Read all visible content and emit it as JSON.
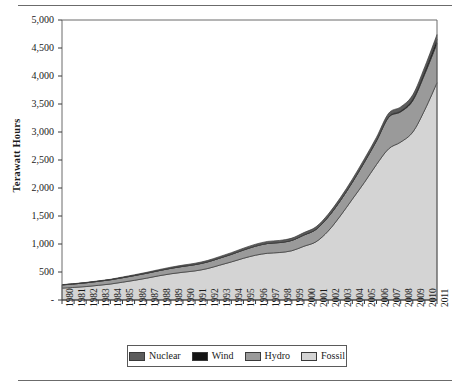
{
  "chart_data": {
    "type": "area",
    "stacked": true,
    "title": "",
    "xlabel": "",
    "ylabel": "Terawatt Hours",
    "ylim": [
      0,
      5000
    ],
    "ytick_labels": [
      "-",
      "500",
      "1,000",
      "1,500",
      "2,000",
      "2,500",
      "3,000",
      "3,500",
      "4,000",
      "4,500",
      "5,000"
    ],
    "ytick_values": [
      0,
      500,
      1000,
      1500,
      2000,
      2500,
      3000,
      3500,
      4000,
      4500,
      5000
    ],
    "grid": false,
    "legend_position": "bottom",
    "categories": [
      "1980",
      "1981",
      "1982",
      "1983",
      "1984",
      "1985",
      "1986",
      "1987",
      "1988",
      "1989",
      "1990",
      "1991",
      "1992",
      "1993",
      "1994",
      "1995",
      "1996",
      "1997",
      "1998",
      "1999",
      "2000",
      "2001",
      "2002",
      "2003",
      "2004",
      "2005",
      "2006",
      "2007",
      "2008",
      "2009",
      "2010",
      "2011"
    ],
    "series": [
      {
        "name": "Fossil",
        "color": "#d4d4d4",
        "values": [
          212,
          225,
          240,
          262,
          285,
          318,
          352,
          390,
          432,
          468,
          496,
          520,
          560,
          620,
          680,
          745,
          800,
          835,
          848,
          880,
          960,
          1040,
          1230,
          1500,
          1800,
          2100,
          2420,
          2700,
          2820,
          3000,
          3400,
          3880
        ]
      },
      {
        "name": "Hydro",
        "color": "#9a9a9a",
        "values": [
          58,
          62,
          68,
          72,
          76,
          80,
          85,
          88,
          92,
          98,
          105,
          112,
          118,
          125,
          135,
          148,
          162,
          175,
          178,
          185,
          200,
          220,
          250,
          270,
          300,
          360,
          420,
          560,
          540,
          560,
          640,
          700
        ]
      },
      {
        "name": "Wind",
        "color": "#141414",
        "values": [
          0,
          0,
          0,
          0,
          0,
          0,
          0,
          0,
          0,
          0,
          0,
          0,
          0,
          0,
          0,
          0,
          0,
          0,
          0,
          0,
          2,
          2,
          3,
          4,
          5,
          7,
          9,
          12,
          18,
          30,
          50,
          74
        ]
      },
      {
        "name": "Nuclear",
        "color": "#5c5c5c",
        "values": [
          4,
          5,
          6,
          7,
          8,
          12,
          14,
          16,
          18,
          20,
          22,
          24,
          26,
          28,
          30,
          32,
          34,
          36,
          38,
          40,
          42,
          45,
          48,
          50,
          52,
          55,
          58,
          62,
          70,
          75,
          80,
          86
        ]
      }
    ],
    "series_stack_order": [
      "Fossil",
      "Hydro",
      "Wind",
      "Nuclear"
    ],
    "legend_order": [
      "Nuclear",
      "Wind",
      "Hydro",
      "Fossil"
    ]
  },
  "legend": {
    "items": [
      {
        "label": "Nuclear",
        "color": "#5c5c5c"
      },
      {
        "label": "Wind",
        "color": "#141414"
      },
      {
        "label": "Hydro",
        "color": "#9a9a9a"
      },
      {
        "label": "Fossil",
        "color": "#d4d4d4"
      }
    ]
  }
}
